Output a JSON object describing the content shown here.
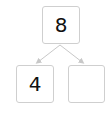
{
  "diagram": {
    "type": "number-bond",
    "whole": "8",
    "parts": [
      "4",
      ""
    ],
    "colors": {
      "border": "#cfcfcf",
      "arrow": "#c8c8c8",
      "text": "#111111"
    }
  }
}
